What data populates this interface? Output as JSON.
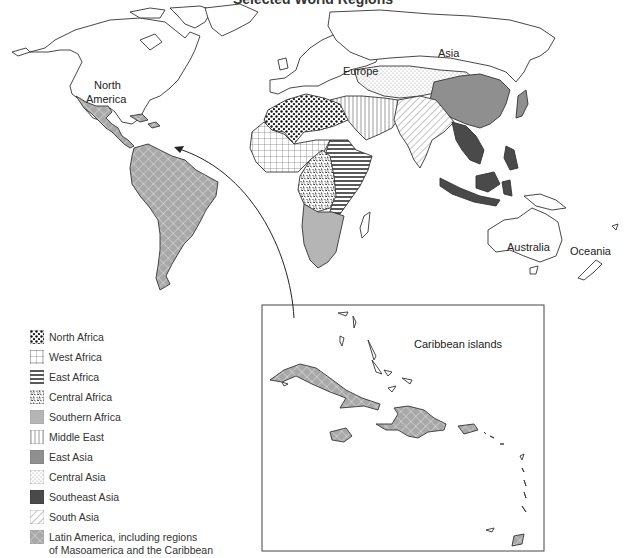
{
  "title": "Selected World Regions",
  "map_labels": {
    "north_america": [
      "North",
      "America"
    ],
    "europe": "Europe",
    "asia": "Asia",
    "australia": "Australia",
    "oceania": "Oceania",
    "caribbean_inset": "Caribbean islands"
  },
  "legend": {
    "items": [
      {
        "id": "north-africa",
        "label": "North Africa",
        "pattern": "dots-dense"
      },
      {
        "id": "west-africa",
        "label": "West Africa",
        "pattern": "grid"
      },
      {
        "id": "east-africa",
        "label": "East Africa",
        "pattern": "horizontal-lines"
      },
      {
        "id": "central-africa",
        "label": "Central Africa",
        "pattern": "squiggle"
      },
      {
        "id": "southern-africa",
        "label": "Southern Africa",
        "pattern": "solid-light-gray",
        "color": "#b5b5b5"
      },
      {
        "id": "middle-east",
        "label": "Middle East",
        "pattern": "vertical-lines"
      },
      {
        "id": "east-asia",
        "label": "East Asia",
        "pattern": "solid-mid-gray",
        "color": "#8f8f8f"
      },
      {
        "id": "central-asia",
        "label": "Central Asia",
        "pattern": "fine-dots"
      },
      {
        "id": "southeast-asia",
        "label": "Southeast Asia",
        "pattern": "solid-dark-gray",
        "color": "#4a4a4a"
      },
      {
        "id": "south-asia",
        "label": "South Asia",
        "pattern": "diagonal-lines"
      },
      {
        "id": "latin-america",
        "label": "Latin America, including regions",
        "label2": "of Masoamerica and the Caribbean",
        "pattern": "gray-crosshatch",
        "color": "#a8a8a8"
      }
    ]
  },
  "inset": {
    "title": "Caribbean islands",
    "arrow": "points from inset to Caribbean in main map"
  }
}
